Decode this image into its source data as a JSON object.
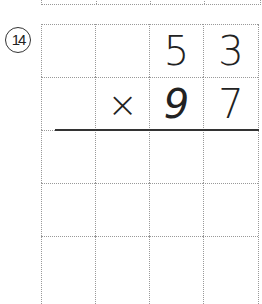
{
  "problem": {
    "number_label": "14",
    "multiplicand": [
      "",
      "",
      "5",
      "3"
    ],
    "multiplier_row": [
      "",
      "×",
      "9",
      "7"
    ],
    "empty_rows": 3,
    "columns": 4
  }
}
